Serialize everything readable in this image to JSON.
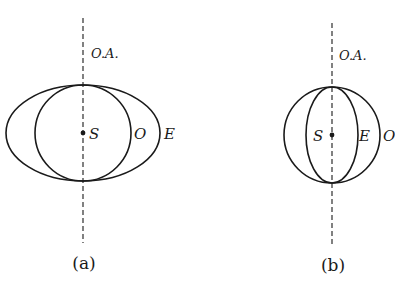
{
  "figure": {
    "panels": [
      {
        "id": "a",
        "caption": "(a)",
        "axis_label": "O.A.",
        "source_label": "S",
        "ordinary_label": "O",
        "extraordinary_label": "E",
        "description": "Ordinary wavefront is a circle; extraordinary wavefront is an ellipse elongated perpendicular to the optic axis, touching the circle along the optic axis."
      },
      {
        "id": "b",
        "caption": "(b)",
        "axis_label": "O.A.",
        "source_label": "S",
        "ordinary_label": "O",
        "extraordinary_label": "E",
        "description": "Ordinary wavefront is a circle; extraordinary wavefront is an ellipse narrower than the circle, touching the circle along the optic axis."
      }
    ]
  }
}
